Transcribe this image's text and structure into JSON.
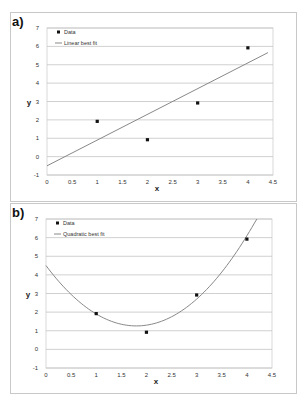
{
  "panels": [
    {
      "label": "a)",
      "legend": {
        "data": "Data",
        "fit": "Linear best fit"
      },
      "xlabel": "x",
      "ylabel": "y"
    },
    {
      "label": "b)",
      "legend": {
        "data": "Data",
        "fit": "Quadratic best fit"
      },
      "xlabel": "x",
      "ylabel": "y"
    }
  ],
  "chart_data": [
    {
      "title": "a)",
      "type": "scatter",
      "xlabel": "x",
      "ylabel": "y",
      "xlim": [
        0,
        4.5
      ],
      "ylim": [
        -1,
        7
      ],
      "xticks": [
        0,
        0.5,
        1,
        1.5,
        2,
        2.5,
        3,
        3.5,
        4,
        4.5
      ],
      "yticks": [
        -1,
        0,
        1,
        2,
        3,
        4,
        5,
        6,
        7
      ],
      "grid": "horizontal",
      "legend_position": "upper-left",
      "series": [
        {
          "name": "Data",
          "kind": "points",
          "x": [
            1,
            2,
            3,
            4
          ],
          "y": [
            2,
            1,
            3,
            6
          ]
        },
        {
          "name": "Linear best fit",
          "kind": "line",
          "equation": "y = 1.4x - 0.5",
          "x": [
            0,
            4.4
          ],
          "y": [
            -0.5,
            5.66
          ]
        }
      ]
    },
    {
      "title": "b)",
      "type": "scatter",
      "xlabel": "x",
      "ylabel": "y",
      "xlim": [
        0,
        4.5
      ],
      "ylim": [
        -1,
        7
      ],
      "xticks": [
        0,
        0.5,
        1,
        1.5,
        2,
        2.5,
        3,
        3.5,
        4,
        4.5
      ],
      "yticks": [
        -1,
        0,
        1,
        2,
        3,
        4,
        5,
        6,
        7
      ],
      "grid": "horizontal",
      "legend_position": "upper-left",
      "series": [
        {
          "name": "Data",
          "kind": "points",
          "x": [
            1,
            2,
            3,
            4
          ],
          "y": [
            2,
            1,
            3,
            6
          ]
        },
        {
          "name": "Quadratic best fit",
          "kind": "curve",
          "equation": "y = x^2 - 3.6x + 4.5",
          "x_range": [
            0,
            4.2
          ]
        }
      ]
    }
  ]
}
